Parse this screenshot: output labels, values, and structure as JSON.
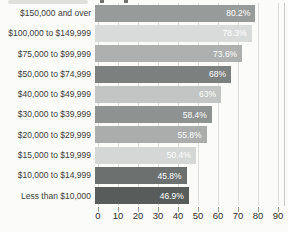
{
  "chart_data": {
    "type": "bar",
    "orientation": "horizontal",
    "title": "",
    "categories": [
      "$150,000 and over",
      "$100,000 to $149,999",
      "$75,000 to $99,999",
      "$50,000 to $74,999",
      "$40,000 to $49,999",
      "$30,000 to $39,999",
      "$20,000 to $29,999",
      "$15,000 to $19,999",
      "$10,000 to $14,999",
      "Less than $10,000"
    ],
    "values": [
      80.2,
      78.3,
      73.6,
      68,
      63,
      58.4,
      55.8,
      50.4,
      45.8,
      46.9
    ],
    "value_labels": [
      "80.2%",
      "78.3%",
      "73.6%",
      "68%",
      "63%",
      "58.4%",
      "55.8%",
      "50.4%",
      "45.8%",
      "46.9%"
    ],
    "x_ticks": [
      "0",
      "10",
      "20",
      "30",
      "40",
      "50",
      "60",
      "70",
      "80",
      "90"
    ],
    "xlim": [
      0,
      90
    ],
    "grid": true,
    "legend": false,
    "bar_colors": [
      "#979b99",
      "#d9dbda",
      "#adb0ae",
      "#7c817f",
      "#c2c5c3",
      "#8e9290",
      "#aaadab",
      "#d5d7d6",
      "#6c716f",
      "#585d5b"
    ],
    "value_label_color": "#ffffff",
    "axis_text_color": "#2f2f2d",
    "category_text_color": "#3c3c3a"
  }
}
